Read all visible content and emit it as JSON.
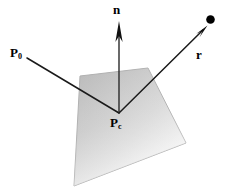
{
  "figure": {
    "background_color": "#ffffff",
    "width": 232,
    "height": 188,
    "labels": {
      "normal": "n",
      "reflected": "r",
      "source_point": "P",
      "source_point_sub": "0",
      "contact_point": "P",
      "contact_point_sub": "c"
    },
    "colors": {
      "stroke": "#1a1a1a",
      "plane_light": "#fdfdfd",
      "plane_mid": "#d2d2d2",
      "plane_dark": "#b0b0b0",
      "plane_edge": "#9a9a9a",
      "dot": "#000000"
    },
    "geometry": {
      "plane_points": "80,76 148,68 186,143 74,186",
      "contact_point": {
        "x": 119,
        "y": 113
      },
      "normal_tip": {
        "x": 119,
        "y": 24
      },
      "normal_tail": {
        "x": 119,
        "y": 113
      },
      "incident_start": {
        "x": 27,
        "y": 58
      },
      "reflected_tip": {
        "x": 206,
        "y": 27
      },
      "endpoint_dot": {
        "x": 210,
        "y": 19,
        "r": 4.2
      }
    }
  }
}
